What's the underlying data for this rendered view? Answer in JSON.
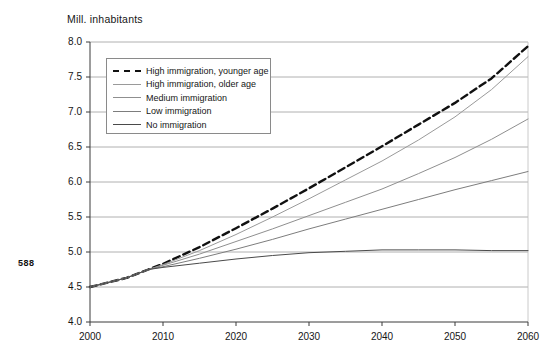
{
  "page_number": "588",
  "axis_title": "Mill. inhabitants",
  "legend": {
    "items": [
      {
        "label": "High immigration, younger age",
        "style": "dashed",
        "color": "#111111",
        "icon": "dashed-line-swatch"
      },
      {
        "label": "High immigration, older age",
        "style": "solid",
        "color": "#9a9a9a",
        "icon": "solid-line-swatch"
      },
      {
        "label": "Medium immigration",
        "style": "solid",
        "color": "#8f8f8f",
        "icon": "solid-line-swatch"
      },
      {
        "label": "Low immigration",
        "style": "solid",
        "color": "#7d7d7d",
        "icon": "solid-line-swatch"
      },
      {
        "label": "No immigration",
        "style": "solid",
        "color": "#4a4a4a",
        "icon": "solid-line-swatch"
      }
    ]
  },
  "chart_data": {
    "type": "line",
    "title": "",
    "subtitle": "",
    "xlabel": "",
    "ylabel": "Mill. inhabitants",
    "xlim": [
      2000,
      2060
    ],
    "ylim": [
      4.0,
      8.0
    ],
    "grid": true,
    "grid_axis": "y",
    "legend_position": "upper-left-inside",
    "xticks": [
      2000,
      2010,
      2020,
      2030,
      2040,
      2050,
      2060
    ],
    "yticks": [
      4.0,
      4.5,
      5.0,
      5.5,
      6.0,
      6.5,
      7.0,
      7.5,
      8.0
    ],
    "ytick_labels": [
      "4.0",
      "4.5",
      "5.0",
      "5.5",
      "6.0",
      "6.5",
      "7.0",
      "7.5",
      "8.0"
    ],
    "xtick_labels": [
      "2000",
      "2010",
      "2020",
      "2030",
      "2040",
      "2050",
      "2060"
    ],
    "x": [
      2000,
      2005,
      2008,
      2010,
      2015,
      2020,
      2025,
      2030,
      2035,
      2040,
      2045,
      2050,
      2055,
      2060
    ],
    "series": [
      {
        "name": "High immigration, younger age",
        "style": "dashed",
        "color": "#111111",
        "width": 2.4,
        "values": [
          4.5,
          4.63,
          4.75,
          4.83,
          5.07,
          5.34,
          5.62,
          5.91,
          6.21,
          6.51,
          6.82,
          7.13,
          7.48,
          7.94
        ]
      },
      {
        "name": "High immigration, older age",
        "style": "solid",
        "color": "#9a9a9a",
        "width": 1.0,
        "values": [
          4.5,
          4.63,
          4.75,
          4.82,
          5.02,
          5.25,
          5.5,
          5.76,
          6.03,
          6.3,
          6.6,
          6.93,
          7.32,
          7.79
        ]
      },
      {
        "name": "Medium immigration",
        "style": "solid",
        "color": "#8f8f8f",
        "width": 1.0,
        "values": [
          4.5,
          4.63,
          4.75,
          4.81,
          4.97,
          5.15,
          5.33,
          5.52,
          5.71,
          5.9,
          6.12,
          6.35,
          6.61,
          6.9
        ]
      },
      {
        "name": "Low immigration",
        "style": "solid",
        "color": "#7d7d7d",
        "width": 1.0,
        "values": [
          4.5,
          4.63,
          4.75,
          4.79,
          4.91,
          5.04,
          5.18,
          5.33,
          5.47,
          5.61,
          5.75,
          5.89,
          6.02,
          6.15
        ]
      },
      {
        "name": "No immigration",
        "style": "solid",
        "color": "#4a4a4a",
        "width": 1.0,
        "values": [
          4.5,
          4.63,
          4.75,
          4.78,
          4.84,
          4.9,
          4.95,
          4.99,
          5.01,
          5.03,
          5.03,
          5.03,
          5.02,
          5.02
        ]
      }
    ]
  }
}
